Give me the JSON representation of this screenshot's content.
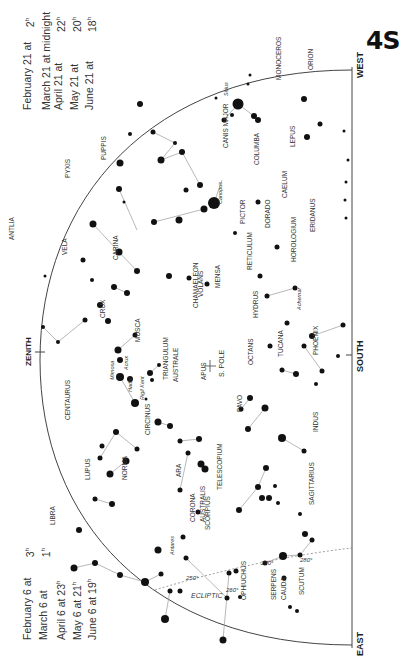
{
  "chart_id": "4S",
  "times_top": [
    {
      "date": "February 21 at",
      "time": "2",
      "unit": "h"
    },
    {
      "date": "March 21 at midnight",
      "time": "",
      "unit": ""
    },
    {
      "date": "April 21 at",
      "time": "22",
      "unit": "h"
    },
    {
      "date": "May 21 at",
      "time": "20",
      "unit": "h"
    },
    {
      "date": "June 21 at",
      "time": "18",
      "unit": "h"
    }
  ],
  "times_bottom": [
    {
      "date": "February 6 at",
      "time": "3",
      "unit": "h"
    },
    {
      "date": "March 6 at",
      "time": "1",
      "unit": "h"
    },
    {
      "date": "April 6 at 23",
      "time": "",
      "unit": "h"
    },
    {
      "date": "May 6 at 21",
      "time": "",
      "unit": "h"
    },
    {
      "date": "June 6 at 19",
      "time": "",
      "unit": "h"
    }
  ],
  "horizon": {
    "west_label": "WEST",
    "south_label": "SOUTH",
    "east_label": "EAST",
    "zenith_label": "ZENITH",
    "pole_label": "S. POLE",
    "ecliptic_label": "ECLIPTIC",
    "ecliptic_marks": [
      "250°",
      "260°",
      "270°",
      "280°"
    ]
  },
  "constellations": [
    {
      "name": "PYXIS",
      "x": 70,
      "y": 178
    },
    {
      "name": "PUPPIS",
      "x": 106,
      "y": 160
    },
    {
      "name": "ANTLIA",
      "x": 14,
      "y": 240
    },
    {
      "name": "VELA",
      "x": 67,
      "y": 255
    },
    {
      "name": "CARINA",
      "x": 118,
      "y": 260
    },
    {
      "name": "CANIS MAJOR",
      "x": 228,
      "y": 148
    },
    {
      "name": "COLUMBA",
      "x": 259,
      "y": 165
    },
    {
      "name": "MONOCEROS",
      "x": 281,
      "y": 80
    },
    {
      "name": "ORION",
      "x": 313,
      "y": 70
    },
    {
      "name": "LEPUS",
      "x": 295,
      "y": 147
    },
    {
      "name": "CAELUM",
      "x": 287,
      "y": 198
    },
    {
      "name": "ERIDANUS",
      "x": 315,
      "y": 232
    },
    {
      "name": "PICTOR",
      "x": 245,
      "y": 224
    },
    {
      "name": "DORADO",
      "x": 270,
      "y": 228
    },
    {
      "name": "HOROLOGIUM",
      "x": 296,
      "y": 262
    },
    {
      "name": "RETICULUM",
      "x": 252,
      "y": 270
    },
    {
      "name": "VOLANS",
      "x": 203,
      "y": 297
    },
    {
      "name": "MENSA",
      "x": 220,
      "y": 288
    },
    {
      "name": "HYDRUS",
      "x": 258,
      "y": 318
    },
    {
      "name": "CHAMAELEON",
      "x": 198,
      "y": 308
    },
    {
      "name": "OCTANS",
      "x": 253,
      "y": 365
    },
    {
      "name": "TUCANA",
      "x": 283,
      "y": 357
    },
    {
      "name": "PHOENIX",
      "x": 318,
      "y": 355
    },
    {
      "name": "CRUX",
      "x": 105,
      "y": 318
    },
    {
      "name": "MUSCA",
      "x": 140,
      "y": 342
    },
    {
      "name": "CENTAURUS",
      "x": 70,
      "y": 420
    },
    {
      "name": "TRIANGULUM",
      "x": 168,
      "y": 380
    },
    {
      "name": "AUSTRALE",
      "x": 178,
      "y": 382
    },
    {
      "name": "APUS",
      "x": 206,
      "y": 380
    },
    {
      "name": "PAVO",
      "x": 242,
      "y": 412
    },
    {
      "name": "INDUS",
      "x": 318,
      "y": 432
    },
    {
      "name": "CIRCINUS",
      "x": 150,
      "y": 435
    },
    {
      "name": "NORMA",
      "x": 127,
      "y": 480
    },
    {
      "name": "ARA",
      "x": 181,
      "y": 477
    },
    {
      "name": "TELESCOPIUM",
      "x": 222,
      "y": 490
    },
    {
      "name": "LUPUS",
      "x": 90,
      "y": 480
    },
    {
      "name": "LIBRA",
      "x": 55,
      "y": 525
    },
    {
      "name": "SCORPIUS",
      "x": 210,
      "y": 530
    },
    {
      "name": "CORONA",
      "x": 195,
      "y": 522
    },
    {
      "name": "AUSTRALIS",
      "x": 205,
      "y": 522
    },
    {
      "name": "SAGITTARIUS",
      "x": 314,
      "y": 505
    },
    {
      "name": "OPHIUCHUS",
      "x": 246,
      "y": 600
    },
    {
      "name": "SERPENS",
      "x": 276,
      "y": 600
    },
    {
      "name": "CAUDA",
      "x": 286,
      "y": 600
    },
    {
      "name": "SCUTUM",
      "x": 304,
      "y": 595
    }
  ],
  "named_stars": [
    {
      "name": "Sirius",
      "x": 228,
      "y": 96
    },
    {
      "name": "Canopus",
      "x": 222,
      "y": 204
    },
    {
      "name": "Achernar",
      "x": 301,
      "y": 310
    },
    {
      "name": "Acrux",
      "x": 128,
      "y": 370
    },
    {
      "name": "Mimosa",
      "x": 114,
      "y": 380
    },
    {
      "name": "Hadar",
      "x": 132,
      "y": 392
    },
    {
      "name": "Rigil Kent",
      "x": 144,
      "y": 400
    },
    {
      "name": "Antares",
      "x": 174,
      "y": 555
    }
  ],
  "stars": [
    [
      238,
      104,
      5.5
    ],
    [
      254,
      116,
      3
    ],
    [
      250,
      75,
      1.5
    ],
    [
      232,
      115,
      2
    ],
    [
      216,
      98,
      1.5
    ],
    [
      224,
      120,
      2.5
    ],
    [
      248,
      84,
      1.5
    ],
    [
      214,
      203,
      6
    ],
    [
      204,
      209,
      3.5
    ],
    [
      154,
      222,
      3
    ],
    [
      235,
      233,
      2
    ],
    [
      207,
      284,
      2.5
    ],
    [
      277,
      247,
      2.5
    ],
    [
      258,
      202,
      2.5
    ],
    [
      258,
      120,
      3
    ],
    [
      304,
      99,
      3
    ],
    [
      307,
      137,
      3
    ],
    [
      320,
      124,
      2.5
    ],
    [
      344,
      131,
      1.5
    ],
    [
      346,
      182,
      1.5
    ],
    [
      348,
      160,
      1.5
    ],
    [
      345,
      200,
      1.5
    ],
    [
      346,
      218,
      1.5
    ],
    [
      161,
      160,
      3.5
    ],
    [
      200,
      185,
      3
    ],
    [
      182,
      152,
      3
    ],
    [
      186,
      190,
      2.5
    ],
    [
      179,
      220,
      3.5
    ],
    [
      189,
      278,
      2.5
    ],
    [
      169,
      276,
      3
    ],
    [
      140,
      104,
      3
    ],
    [
      175,
      143,
      2
    ],
    [
      153,
      132,
      2.5
    ],
    [
      120,
      163,
      3.5
    ],
    [
      130,
      134,
      2
    ],
    [
      119,
      189,
      3
    ],
    [
      124,
      202,
      1.5
    ],
    [
      93,
      224,
      3.5
    ],
    [
      119,
      252,
      3.5
    ],
    [
      137,
      271,
      3
    ],
    [
      114,
      287,
      3
    ],
    [
      127,
      293,
      3
    ],
    [
      83,
      260,
      2.5
    ],
    [
      92,
      280,
      2
    ],
    [
      100,
      305,
      3
    ],
    [
      45,
      276,
      1.5
    ],
    [
      43,
      327,
      2
    ],
    [
      58,
      342,
      2
    ],
    [
      85,
      320,
      2.5
    ],
    [
      108,
      321,
      3
    ],
    [
      118,
      350,
      3.5
    ],
    [
      120,
      360,
      3
    ],
    [
      135,
      335,
      2.5
    ],
    [
      150,
      373,
      3
    ],
    [
      159,
      365,
      2
    ],
    [
      130,
      379,
      3
    ],
    [
      120,
      377,
      4
    ],
    [
      135,
      403,
      4
    ],
    [
      152,
      380,
      2
    ],
    [
      146,
      399,
      1.5
    ],
    [
      137,
      449,
      2.5
    ],
    [
      116,
      432,
      3
    ],
    [
      126,
      461,
      3.5
    ],
    [
      110,
      474,
      3.5
    ],
    [
      100,
      458,
      2.5
    ],
    [
      102,
      446,
      2.5
    ],
    [
      112,
      504,
      3
    ],
    [
      95,
      499,
      2.5
    ],
    [
      158,
      422,
      3.5
    ],
    [
      180,
      441,
      2.5
    ],
    [
      198,
      512,
      2.5
    ],
    [
      201,
      464,
      3.5
    ],
    [
      205,
      469,
      3.5
    ],
    [
      188,
      453,
      2.5
    ],
    [
      180,
      490,
      2.5
    ],
    [
      170,
      426,
      3
    ],
    [
      199,
      439,
      3
    ],
    [
      250,
      398,
      3
    ],
    [
      241,
      409,
      2.5
    ],
    [
      248,
      429,
      3
    ],
    [
      265,
      408,
      3.5
    ],
    [
      282,
      438,
      4
    ],
    [
      304,
      451,
      2.5
    ],
    [
      296,
      374,
      3
    ],
    [
      282,
      370,
      2.5
    ],
    [
      304,
      346,
      2.5
    ],
    [
      322,
      371,
      2.5
    ],
    [
      343,
      325,
      2.5
    ],
    [
      338,
      356,
      2
    ],
    [
      312,
      336,
      3
    ],
    [
      316,
      384,
      2
    ],
    [
      270,
      346,
      2.5
    ],
    [
      287,
      323,
      2.5
    ],
    [
      267,
      296,
      2.5
    ],
    [
      295,
      288,
      2.5
    ],
    [
      260,
      276,
      2.5
    ],
    [
      74,
      568,
      3.5
    ],
    [
      79,
      530,
      3
    ],
    [
      95,
      563,
      3
    ],
    [
      120,
      575,
      3
    ],
    [
      145,
      582,
      4
    ],
    [
      161,
      574,
      2.5
    ],
    [
      158,
      550,
      3.5
    ],
    [
      183,
      537,
      2.5
    ],
    [
      165,
      619,
      4
    ],
    [
      170,
      591,
      2.5
    ],
    [
      180,
      591,
      2.5
    ],
    [
      186,
      558,
      2.5
    ],
    [
      227,
      598,
      2.5
    ],
    [
      223,
      640,
      3.5
    ],
    [
      229,
      573,
      2.5
    ],
    [
      236,
      571,
      2.5
    ],
    [
      240,
      597,
      2
    ],
    [
      265,
      563,
      2.5
    ],
    [
      283,
      556,
      4
    ],
    [
      300,
      555,
      2.5
    ],
    [
      312,
      540,
      2.5
    ],
    [
      284,
      578,
      2.5
    ],
    [
      290,
      607,
      2
    ],
    [
      297,
      611,
      2
    ],
    [
      239,
      510,
      3
    ],
    [
      258,
      487,
      3
    ],
    [
      266,
      468,
      3
    ],
    [
      275,
      486,
      2
    ],
    [
      278,
      503,
      2
    ],
    [
      262,
      498,
      3
    ],
    [
      269,
      498,
      3
    ],
    [
      305,
      534,
      3
    ],
    [
      300,
      514,
      2
    ]
  ],
  "lines": [
    [
      [
        238,
        104
      ],
      [
        254,
        116
      ]
    ],
    [
      [
        224,
        120
      ],
      [
        238,
        104
      ]
    ],
    [
      [
        214,
        203
      ],
      [
        222,
        180
      ]
    ],
    [
      [
        204,
        209
      ],
      [
        154,
        222
      ]
    ],
    [
      [
        161,
        160
      ],
      [
        182,
        152
      ]
    ],
    [
      [
        182,
        152
      ],
      [
        200,
        185
      ]
    ],
    [
      [
        161,
        160
      ],
      [
        175,
        143
      ]
    ],
    [
      [
        153,
        132
      ],
      [
        175,
        143
      ]
    ],
    [
      [
        119,
        189
      ],
      [
        137,
        230
      ]
    ],
    [
      [
        93,
        224
      ],
      [
        119,
        252
      ]
    ],
    [
      [
        119,
        252
      ],
      [
        137,
        271
      ]
    ],
    [
      [
        114,
        287
      ],
      [
        127,
        293
      ]
    ],
    [
      [
        43,
        327
      ],
      [
        58,
        342
      ]
    ],
    [
      [
        58,
        342
      ],
      [
        85,
        320
      ]
    ],
    [
      [
        118,
        350
      ],
      [
        135,
        335
      ]
    ],
    [
      [
        150,
        373
      ],
      [
        159,
        365
      ]
    ],
    [
      [
        120,
        377
      ],
      [
        135,
        403
      ]
    ],
    [
      [
        158,
        422
      ],
      [
        170,
        426
      ]
    ],
    [
      [
        180,
        441
      ],
      [
        199,
        439
      ]
    ],
    [
      [
        201,
        464
      ],
      [
        205,
        469
      ]
    ],
    [
      [
        188,
        453
      ],
      [
        180,
        490
      ]
    ],
    [
      [
        241,
        409
      ],
      [
        250,
        398
      ]
    ],
    [
      [
        248,
        429
      ],
      [
        265,
        408
      ]
    ],
    [
      [
        282,
        438
      ],
      [
        304,
        451
      ]
    ],
    [
      [
        282,
        370
      ],
      [
        296,
        374
      ]
    ],
    [
      [
        304,
        346
      ],
      [
        322,
        371
      ]
    ],
    [
      [
        312,
        336
      ],
      [
        343,
        325
      ]
    ],
    [
      [
        267,
        296
      ],
      [
        295,
        288
      ]
    ],
    [
      [
        74,
        568
      ],
      [
        95,
        563
      ]
    ],
    [
      [
        95,
        563
      ],
      [
        120,
        575
      ]
    ],
    [
      [
        120,
        575
      ],
      [
        145,
        582
      ]
    ],
    [
      [
        145,
        582
      ],
      [
        161,
        574
      ]
    ],
    [
      [
        165,
        619
      ],
      [
        170,
        591
      ]
    ],
    [
      [
        186,
        558
      ],
      [
        227,
        598
      ]
    ],
    [
      [
        223,
        640
      ],
      [
        229,
        573
      ]
    ],
    [
      [
        265,
        563
      ],
      [
        283,
        556
      ]
    ],
    [
      [
        283,
        556
      ],
      [
        300,
        555
      ]
    ],
    [
      [
        300,
        555
      ],
      [
        312,
        540
      ]
    ],
    [
      [
        239,
        510
      ],
      [
        258,
        487
      ]
    ],
    [
      [
        258,
        487
      ],
      [
        266,
        468
      ]
    ],
    [
      [
        137,
        449
      ],
      [
        116,
        432
      ]
    ],
    [
      [
        116,
        432
      ],
      [
        100,
        458
      ]
    ],
    [
      [
        126,
        461
      ],
      [
        110,
        474
      ]
    ],
    [
      [
        95,
        499
      ],
      [
        112,
        504
      ]
    ]
  ]
}
